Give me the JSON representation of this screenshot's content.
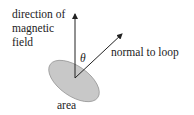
{
  "diagram": {
    "labels": {
      "field_line1": "direction of",
      "field_line2": "magnetic",
      "field_line3": "field",
      "normal": "normal to loop",
      "angle": "θ",
      "area": "area"
    },
    "colors": {
      "loop_fill": "#c8c8c8",
      "loop_stroke": "#9a9a9a",
      "arrow": "#222222"
    }
  }
}
